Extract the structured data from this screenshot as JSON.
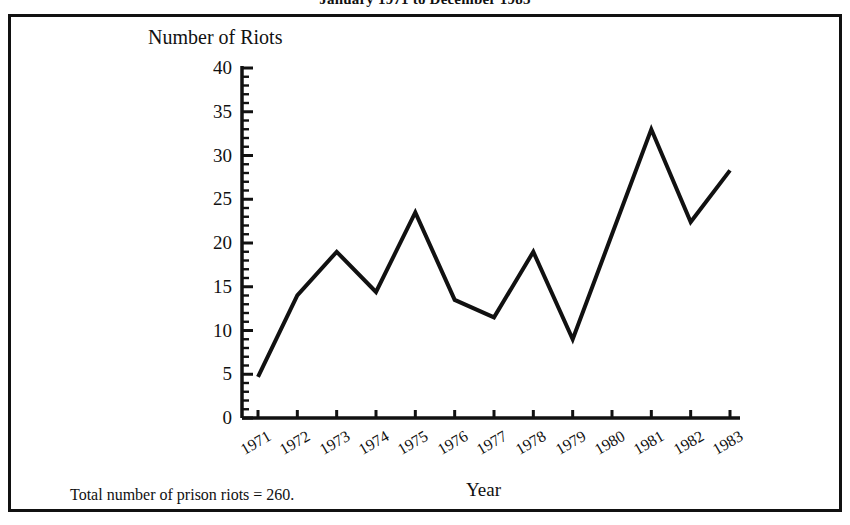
{
  "document": {
    "title": "January 1971 to December 1983"
  },
  "figure": {
    "footnote": "Total number of prison riots = 260."
  },
  "chart_data": {
    "type": "line",
    "title": "January 1971 to December 1983",
    "xlabel": "Year",
    "ylabel": "Number of Riots",
    "categories": [
      "1971",
      "1972",
      "1973",
      "1974",
      "1975",
      "1976",
      "1977",
      "1978",
      "1979",
      "1980",
      "1981",
      "1982",
      "1983"
    ],
    "values": [
      4.7,
      14,
      19,
      14.4,
      23.5,
      13.5,
      11.5,
      19,
      9,
      21,
      33,
      22.4,
      28.3
    ],
    "ylim": [
      0,
      40
    ],
    "ytick_labels": [
      "0",
      "5",
      "10",
      "15",
      "20",
      "25",
      "30",
      "35",
      "40"
    ],
    "ytick_values": [
      0,
      5,
      10,
      15,
      20,
      25,
      30,
      35,
      40
    ],
    "yminor_step": 1,
    "grid": false,
    "legend": false,
    "line_color": "#111111",
    "annotation": "Total number of prison riots = 260."
  }
}
